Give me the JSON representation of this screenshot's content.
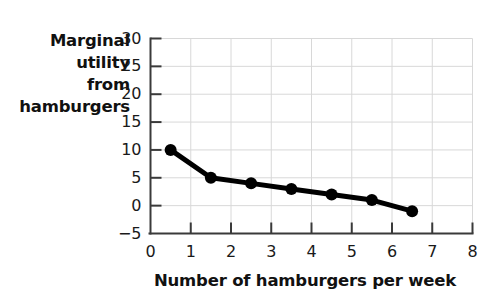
{
  "chart_data": {
    "type": "line",
    "title": "",
    "xlabel": "Number of hamburgers per week",
    "ylabel": "Marginal utility from hamburgers",
    "ylabel_lines": [
      "Marginal",
      "utility",
      "from",
      "hamburgers"
    ],
    "x": [
      0.5,
      1.5,
      2.5,
      3.5,
      4.5,
      5.5,
      6.5
    ],
    "values": [
      10,
      5,
      4,
      3,
      2,
      1,
      -1
    ],
    "points": [
      {
        "x": 0.5,
        "y": 10
      },
      {
        "x": 1.5,
        "y": 5
      },
      {
        "x": 2.5,
        "y": 4
      },
      {
        "x": 3.5,
        "y": 3
      },
      {
        "x": 4.5,
        "y": 2
      },
      {
        "x": 5.5,
        "y": 1
      },
      {
        "x": 6.5,
        "y": -1
      }
    ],
    "xlim": [
      0,
      8
    ],
    "ylim": [
      -5,
      30
    ],
    "xticks": [
      "0",
      "1",
      "2",
      "3",
      "4",
      "5",
      "6",
      "7",
      "8"
    ],
    "yticks": [
      "30",
      "25",
      "20",
      "15",
      "10",
      "5",
      "0",
      "-5"
    ],
    "xtick_values": [
      0,
      1,
      2,
      3,
      4,
      5,
      6,
      7,
      8
    ],
    "ytick_values": [
      30,
      25,
      20,
      15,
      10,
      5,
      0,
      -5
    ],
    "grid": true,
    "legend": false,
    "legend_position": "none",
    "series_color": "#000000",
    "grid_color": "#d8d8d8",
    "axis_color": "#3a3a3a",
    "marker": "circle",
    "marker_size": 9
  }
}
